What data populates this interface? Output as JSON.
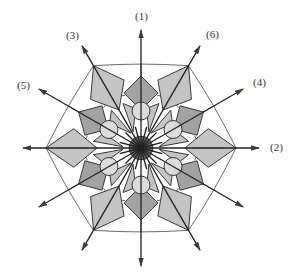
{
  "figure": {
    "center": [
      141,
      148
    ],
    "colors": {
      "stroke": "#3a3a3a",
      "light_fill": "#c4c4c4",
      "dark_fill": "#a2a2a2",
      "circle_fill": "#dcdcdc",
      "core_fill": "#6a6a6a",
      "background": "#ffffff"
    },
    "axes": [
      {
        "label": "(1)",
        "angle": 90,
        "length": 118,
        "label_pos": [
          135,
          11
        ]
      },
      {
        "label": "(2)",
        "angle": 0,
        "length": 118,
        "label_pos": [
          270,
          142
        ]
      },
      {
        "label": "(3)",
        "angle": 120,
        "length": 118,
        "label_pos": [
          66,
          30
        ]
      },
      {
        "label": "(4)",
        "angle": 30,
        "length": 118,
        "label_pos": [
          253,
          77
        ]
      },
      {
        "label": "(5)",
        "angle": 150,
        "length": 118,
        "label_pos": [
          17,
          80
        ]
      },
      {
        "label": "(6)",
        "angle": 60,
        "length": 118,
        "label_pos": [
          206,
          29
        ]
      }
    ],
    "hexagon_radius": 95,
    "diamond_radius": 55,
    "diamond_half": 17,
    "kite": {
      "inner_r": 30,
      "outer_r": 95,
      "half_width": 19,
      "width_at_r": 70
    },
    "circle": {
      "r": 9,
      "dist": 37
    },
    "core_radius": 12
  }
}
